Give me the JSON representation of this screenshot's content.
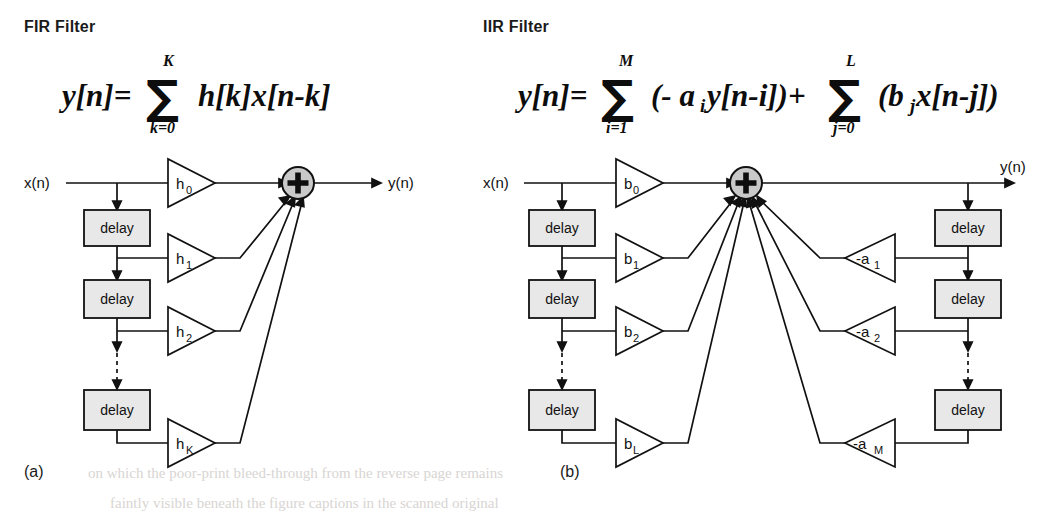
{
  "figure": {
    "background_color": "#ffffff",
    "ink_color": "#111111",
    "box_fill": "#e8e8e8",
    "sum_fill": "#c9c9c9"
  },
  "panels": [
    {
      "id": "fir",
      "heading": "FIR Filter",
      "caption": "(a)",
      "equation": {
        "lhs": "y[n]=",
        "sigma": "∑",
        "upper_limit": "K",
        "lower_limit": "k=0",
        "body": "h[k]x[n-k]"
      },
      "input_label": "x(n)",
      "output_label": "y(n)",
      "delay_label": "delay",
      "delays": [
        "delay",
        "delay",
        "delay"
      ],
      "gains": [
        {
          "base": "h",
          "sub": "0"
        },
        {
          "base": "h",
          "sub": "1"
        },
        {
          "base": "h",
          "sub": "2"
        },
        {
          "base": "h",
          "sub": "K"
        }
      ],
      "sum_symbol": "+",
      "has_dashed_continuation": true
    },
    {
      "id": "iir",
      "heading": "IIR Filter",
      "caption": "(b)",
      "equation": {
        "lhs": "y[n]=",
        "sigma": "∑",
        "upper_limit_1": "M",
        "lower_limit_1": "i=1",
        "body_1": "(- a",
        "body_1_sub": "i",
        "body_1_rest": "y[n-i])+",
        "upper_limit_2": "L",
        "lower_limit_2": "j=0",
        "body_2": "(b",
        "body_2_sub": "j",
        "body_2_rest": "x[n-j])"
      },
      "input_label": "x(n)",
      "output_label": "y(n)",
      "delay_label": "delay",
      "feedforward_delays": [
        "delay",
        "delay",
        "delay"
      ],
      "feedback_delays": [
        "delay",
        "delay",
        "delay"
      ],
      "feedforward_gains": [
        {
          "base": "b",
          "sub": "0"
        },
        {
          "base": "b",
          "sub": "1"
        },
        {
          "base": "b",
          "sub": "2"
        },
        {
          "base": "b",
          "sub": "L"
        }
      ],
      "feedback_gains": [
        {
          "base": "-a",
          "sub": "1"
        },
        {
          "base": "-a",
          "sub": "2"
        },
        {
          "base": "-a",
          "sub": "M"
        }
      ],
      "sum_symbol": "+",
      "has_dashed_continuation": true
    }
  ],
  "scan_artifacts": {
    "line1": "on which the poor-print bleed-through from the reverse page remains",
    "line2": "faintly visible beneath the figure captions in the scanned original"
  }
}
